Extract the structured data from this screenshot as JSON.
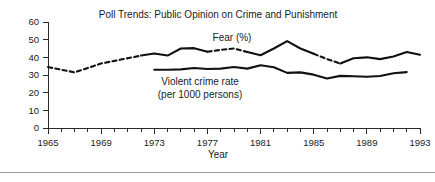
{
  "chart_data": {
    "type": "line",
    "title": "Poll Trends: Public Opinion on Crime and Punishment",
    "xlabel": "Year",
    "ylabel": "",
    "xlim": [
      1965,
      1993
    ],
    "ylim": [
      0,
      60
    ],
    "grid": false,
    "legend_position": "inline-annotation",
    "x_ticks": [
      1965,
      1966,
      1967,
      1968,
      1969,
      1970,
      1971,
      1972,
      1973,
      1974,
      1975,
      1976,
      1977,
      1978,
      1979,
      1980,
      1981,
      1982,
      1983,
      1984,
      1985,
      1986,
      1987,
      1988,
      1989,
      1990,
      1991,
      1992,
      1993
    ],
    "x_tick_labels": [
      "1965",
      "",
      "",
      "",
      "1969",
      "",
      "",
      "",
      "1973",
      "",
      "",
      "",
      "1977",
      "",
      "",
      "",
      "1981",
      "",
      "",
      "",
      "1985",
      "",
      "",
      "",
      "1989",
      "",
      "",
      "",
      "1993"
    ],
    "y_ticks": [
      0,
      10,
      20,
      30,
      40,
      50,
      60
    ],
    "y_tick_labels": [
      "0",
      "10",
      "20",
      "30",
      "40",
      "50",
      "60"
    ],
    "series": [
      {
        "name": "Fear (%)",
        "label": "Fear (%)",
        "style": "mixed-dashed-solid",
        "color": "#111111",
        "x": [
          1965,
          1966,
          1967,
          1968,
          1969,
          1970,
          1971,
          1972,
          1973,
          1974,
          1975,
          1976,
          1977,
          1978,
          1979,
          1980,
          1981,
          1982,
          1983,
          1984,
          1985,
          1986,
          1987,
          1988,
          1989,
          1990,
          1991,
          1992,
          1993
        ],
        "values": [
          34.5,
          33.0,
          31.5,
          34.0,
          36.5,
          38.0,
          39.5,
          41.0,
          42.2,
          41.0,
          45.0,
          45.2,
          43.2,
          44.2,
          45.0,
          43.0,
          41.2,
          45.0,
          49.2,
          45.0,
          42.0,
          39.0,
          36.5,
          39.5,
          40.0,
          39.0,
          40.5,
          43.0,
          41.5
        ],
        "segments": [
          {
            "from": 1965,
            "to": 1972,
            "dashed": true
          },
          {
            "from": 1972,
            "to": 1977,
            "dashed": false
          },
          {
            "from": 1977,
            "to": 1980,
            "dashed": true
          },
          {
            "from": 1980,
            "to": 1985,
            "dashed": false
          },
          {
            "from": 1985,
            "to": 1987,
            "dashed": true
          },
          {
            "from": 1987,
            "to": 1993,
            "dashed": false
          }
        ]
      },
      {
        "name": "Violent crime rate",
        "label": "Violent crime rate",
        "label_line2": "(per 1000 persons)",
        "style": "solid",
        "color": "#111111",
        "x": [
          1973,
          1974,
          1975,
          1976,
          1977,
          1978,
          1979,
          1980,
          1981,
          1982,
          1983,
          1984,
          1985,
          1986,
          1987,
          1988,
          1989,
          1990,
          1991,
          1992
        ],
        "values": [
          33.0,
          33.0,
          33.2,
          34.0,
          33.4,
          33.6,
          34.5,
          33.6,
          35.5,
          34.4,
          31.2,
          31.5,
          30.2,
          28.0,
          29.5,
          29.3,
          29.0,
          29.4,
          31.0,
          31.6
        ]
      }
    ],
    "annotations": [
      {
        "text": "Fear (%)",
        "x": 1977,
        "y": 52
      },
      {
        "text": "Violent crime rate",
        "x": 1975.5,
        "y": 27
      },
      {
        "text": "(per 1000 persons)",
        "x": 1975.5,
        "y": 22
      }
    ]
  },
  "labels": {
    "title": "Poll Trends: Public Opinion on Crime and Punishment",
    "xaxis_title": "Year",
    "fear_label": "Fear (%)",
    "crime_label_line1": "Violent crime rate",
    "crime_label_line2": "(per 1000 persons)"
  }
}
